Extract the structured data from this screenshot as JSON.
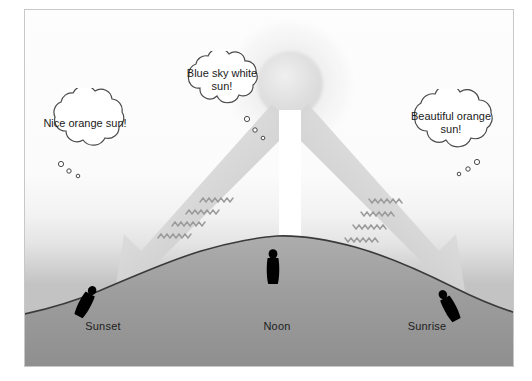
{
  "diagram": {
    "background_color": "#ffffff",
    "frame_border_color": "#c8c8c8",
    "sky_top_color": "#fdfdfd",
    "sky_horizon_color": "#c3c3c3",
    "earth_color": "#a0a0a0",
    "earth_outline_color": "#3a3a3a",
    "ray_color": "#c9c9c9",
    "noon_ray_color": "#ffffff",
    "figure_color": "#000000",
    "sun": {
      "name": "sun",
      "halo_color": "#f3f3f3",
      "disc_color": "#e2e2e2",
      "center_x": 265,
      "center_y": 74,
      "disc_radius": 33,
      "halo_radius": 62
    },
    "rays": [
      {
        "name": "ray-to-sunset",
        "label": "slanted sunlight toward sunset side",
        "direction": "down-left",
        "color": "#c9c9c9"
      },
      {
        "name": "ray-to-noon",
        "label": "direct sunlight overhead at noon",
        "direction": "down",
        "color": "#ffffff"
      },
      {
        "name": "ray-to-sunrise",
        "label": "slanted sunlight toward sunrise side",
        "direction": "down-right",
        "color": "#c9c9c9"
      }
    ],
    "scatter_marks": {
      "name": "scattered-light-squiggles",
      "left_count": 4,
      "right_count": 4,
      "color": "#9e9e9e",
      "description": "wavy zig-zag lines showing light scattered by the atmosphere"
    },
    "bubbles": [
      {
        "id": "sunset",
        "name": "thought-bubble-sunset",
        "text": "Nice orange sun!",
        "fill": "#ffffff",
        "stroke": "#4a4a4a"
      },
      {
        "id": "noon",
        "name": "thought-bubble-noon",
        "text": "Blue sky white sun!",
        "fill": "#ffffff",
        "stroke": "#4a4a4a"
      },
      {
        "id": "sunrise",
        "name": "thought-bubble-sunrise",
        "text": "Beautiful orange sun!",
        "fill": "#ffffff",
        "stroke": "#4a4a4a"
      }
    ],
    "observers": [
      {
        "id": "sunset",
        "name": "observer-figure-sunset",
        "posture": "tilted-left",
        "label": "Sunset"
      },
      {
        "id": "noon",
        "name": "observer-figure-noon",
        "posture": "upright",
        "label": "Noon"
      },
      {
        "id": "sunrise",
        "name": "observer-figure-sunrise",
        "posture": "tilted-right",
        "label": "Sunrise"
      }
    ],
    "ground_labels": {
      "sunset": "Sunset",
      "noon": "Noon",
      "sunrise": "Sunrise"
    }
  }
}
